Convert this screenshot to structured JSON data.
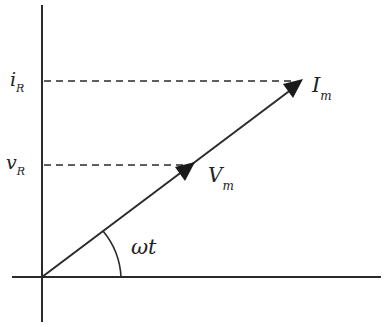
{
  "diagram": {
    "type": "phasor-diagram",
    "labels": {
      "i_R": {
        "main": "i",
        "sub": "R"
      },
      "v_R": {
        "main": "v",
        "sub": "R"
      },
      "I_m": {
        "main": "I",
        "sub": "m"
      },
      "V_m": {
        "main": "V",
        "sub": "m"
      },
      "angle": "ωt"
    },
    "colors": {
      "line": "#2a2a2a",
      "background": "#ffffff"
    }
  }
}
